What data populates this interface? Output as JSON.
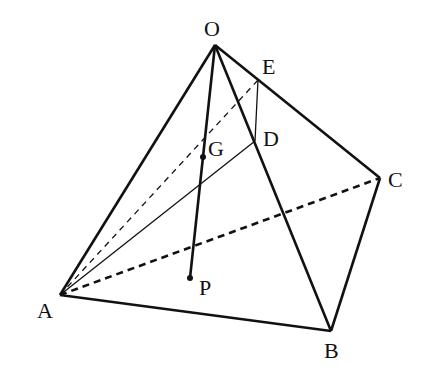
{
  "diagram": {
    "type": "tetrahedron",
    "vertices": {
      "O": {
        "x": 215,
        "y": 45
      },
      "A": {
        "x": 60,
        "y": 295
      },
      "B": {
        "x": 331,
        "y": 331
      },
      "C": {
        "x": 380,
        "y": 178
      }
    },
    "points": {
      "E": {
        "x": 258,
        "y": 80
      },
      "D": {
        "x": 255,
        "y": 141
      },
      "G": {
        "x": 203,
        "y": 157
      },
      "P": {
        "x": 190,
        "y": 278
      }
    },
    "labels": {
      "O": "O",
      "A": "A",
      "B": "B",
      "C": "C",
      "D": "D",
      "E": "E",
      "G": "G",
      "P": "P"
    },
    "edges_solid": [
      [
        "O",
        "A"
      ],
      [
        "O",
        "B"
      ],
      [
        "O",
        "C"
      ],
      [
        "A",
        "B"
      ],
      [
        "B",
        "C"
      ],
      [
        "O",
        "P"
      ],
      [
        "A",
        "D"
      ],
      [
        "E",
        "D"
      ]
    ],
    "edges_dashed": [
      [
        "A",
        "C"
      ],
      [
        "A",
        "E"
      ]
    ],
    "colors": {
      "stroke": "#111111",
      "background": "#ffffff"
    }
  }
}
